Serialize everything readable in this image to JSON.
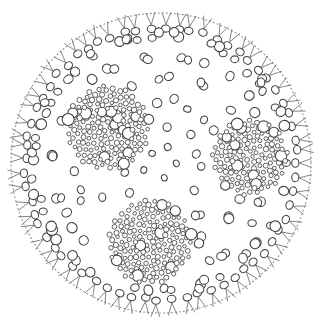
{
  "illustration": {
    "subject": "Volvox colony line drawing",
    "colors": {
      "stroke": "#444444",
      "dots": "#9a9a9a",
      "background": "#ffffff"
    },
    "boundary": {
      "cx": 161,
      "cy": 163,
      "rx": 150,
      "ry": 150
    },
    "edge_cell_count": 64,
    "inner_rings": [
      {
        "r": 128,
        "count": 46,
        "size": 4.2
      },
      {
        "r": 108,
        "count": 36,
        "size": 4.0
      },
      {
        "r": 86,
        "count": 28,
        "size": 3.8
      },
      {
        "r": 64,
        "count": 20,
        "size": 3.6
      },
      {
        "r": 40,
        "count": 12,
        "size": 3.4
      },
      {
        "r": 16,
        "count": 5,
        "size": 3.2
      }
    ],
    "daughter_colonies": [
      {
        "cx": 108,
        "cy": 128,
        "r": 42
      },
      {
        "cx": 250,
        "cy": 157,
        "r": 38
      },
      {
        "cx": 150,
        "cy": 242,
        "r": 42
      }
    ]
  }
}
